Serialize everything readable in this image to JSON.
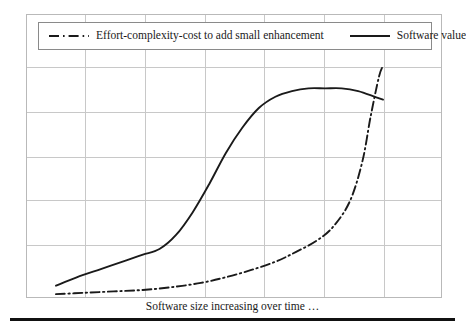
{
  "figure": {
    "caption_below": "Software size increasing over time …",
    "background_color": "#ffffff",
    "frame_color": "#b9b9b9",
    "grid_color": "#c8c8c8",
    "line_color": "#1a1a1a",
    "rule_color": "#111111"
  },
  "legend": {
    "position": "top-inside",
    "entries": [
      {
        "label": "Effort-complexity-cost to add small enhancement",
        "style": "dash-dot",
        "swatch_name": "dash-dot-line-swatch"
      },
      {
        "label": "Software value",
        "style": "solid",
        "swatch_name": "solid-line-swatch"
      }
    ]
  },
  "chart_data": {
    "type": "line",
    "title": "",
    "subtitle": "",
    "xlabel": "Software size increasing over time …",
    "ylabel": "",
    "xlim": [
      0,
      100
    ],
    "ylim": [
      0,
      100
    ],
    "grid": true,
    "x_ticks": [
      0,
      14.3,
      28.6,
      42.9,
      57.1,
      71.4,
      85.7,
      100
    ],
    "x_tick_labels": [
      "",
      "",
      "",
      "",
      "",
      "",
      "",
      ""
    ],
    "y_ticks": [
      0,
      16.7,
      33.3,
      50,
      66.7,
      83.3,
      100
    ],
    "y_tick_labels": [
      "",
      "",
      "",
      "",
      "",
      "",
      ""
    ],
    "legend_position": "upper-inside",
    "annotations": [],
    "series": [
      {
        "name": "Software value",
        "style": "solid",
        "color": "#1a1a1a",
        "x": [
          7,
          12,
          18,
          24,
          28,
          32,
          36,
          40,
          44,
          48,
          52,
          56,
          60,
          64,
          68,
          72,
          76,
          80,
          84,
          86
        ],
        "y": [
          4,
          7,
          10,
          13,
          15,
          17,
          22,
          30,
          40,
          51,
          60,
          67,
          71,
          73,
          74,
          74,
          74,
          73,
          71,
          70
        ]
      },
      {
        "name": "Effort-complexity-cost to add small enhancement",
        "style": "dash-dot",
        "color": "#1a1a1a",
        "x": [
          7,
          14,
          21,
          28,
          35,
          42,
          48,
          54,
          60,
          65,
          70,
          74,
          78,
          81,
          83,
          85,
          86
        ],
        "y": [
          1,
          1.5,
          2,
          2.5,
          3.5,
          5,
          7,
          9.5,
          12.5,
          16,
          20,
          25,
          34,
          48,
          64,
          78,
          82
        ]
      }
    ]
  },
  "grid_geometry": {
    "vertical_fractions": [
      0.139,
      0.284,
      0.428,
      0.57,
      0.714,
      0.858
    ],
    "horizontal_fractions": [
      0.183,
      0.342,
      0.5,
      0.651,
      0.81
    ]
  }
}
